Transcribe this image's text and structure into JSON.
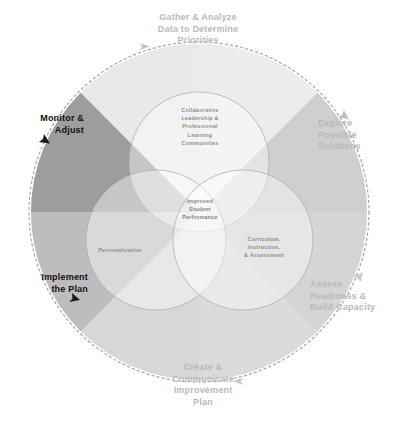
{
  "diagram": {
    "center": {
      "label": "Improved\nStudent\nPerformance"
    },
    "venn_circles": [
      {
        "id": "collaborative-leadership",
        "label": "Collaborative\nLeadership &\nProfessional\nLearning\nCommunities",
        "position": "top"
      },
      {
        "id": "personalization",
        "label": "Personalization",
        "position": "left"
      },
      {
        "id": "curriculum-instruction-assessment",
        "label": "Curriculum,\nInstruction,\n& Assessment",
        "position": "right"
      }
    ],
    "cycle_steps": [
      {
        "id": "gather-analyze",
        "label": "Gather & Analyze\nData to Determine\nPriorities",
        "position": "top",
        "emphasis": "light",
        "color": "#b9b9b9"
      },
      {
        "id": "explore-solutions",
        "label": "Explore\nPossible\nSolutions",
        "position": "right-top",
        "emphasis": "light",
        "color": "#b9b9b9"
      },
      {
        "id": "assess-readiness",
        "label": "Assess\nReadiness &\nBuild Capacity",
        "position": "right-bottom",
        "emphasis": "light",
        "color": "#b9b9b9"
      },
      {
        "id": "create-communicate",
        "label": "Create &\nCommunicate\nImprovement\nPlan",
        "position": "bottom",
        "emphasis": "light",
        "color": "#b9b9b9"
      },
      {
        "id": "implement-plan",
        "label": "Implement\nthe Plan",
        "position": "left-bottom",
        "emphasis": "dark",
        "color": "#111111"
      },
      {
        "id": "monitor-adjust",
        "label": "Monitor &\nAdjust",
        "position": "left-top",
        "emphasis": "dark",
        "color": "#111111"
      }
    ],
    "wedges": [
      {
        "id": "wedge-n",
        "fill": "#e4e4e4"
      },
      {
        "id": "wedge-ne",
        "fill": "#c9c9c9"
      },
      {
        "id": "wedge-e",
        "fill": "#d6d6d6"
      },
      {
        "id": "wedge-se",
        "fill": "#dcdcdc"
      },
      {
        "id": "wedge-s",
        "fill": "#e1e1e1"
      },
      {
        "id": "wedge-sw",
        "fill": "#c2c2c2"
      },
      {
        "id": "wedge-w",
        "fill": "#bdbdbd"
      },
      {
        "id": "wedge-nw",
        "fill": "#949494"
      }
    ],
    "ring": {
      "stroke": "#9a9a9a",
      "dash": "3 2"
    },
    "background": "#ffffff"
  }
}
